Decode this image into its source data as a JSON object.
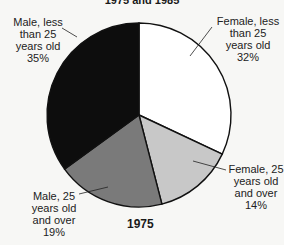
{
  "title_partial": "1975 and 1985",
  "chart_data": {
    "type": "pie",
    "title": "1975",
    "start_angle_deg": 90,
    "direction": "clockwise",
    "slices": [
      {
        "label": "Female, less than 25 years old",
        "value": 32,
        "color": "#ffffff"
      },
      {
        "label": "Female, 25 years old and over",
        "value": 14,
        "color": "#c8c8c8"
      },
      {
        "label": "Male, 25 years old and over",
        "value": 19,
        "color": "#7a7a7a"
      },
      {
        "label": "Male, less than 25 years old",
        "value": 35,
        "color": "#0d0d0d"
      }
    ]
  },
  "labels": {
    "female_lt25": {
      "l1": "Female, less",
      "l2": "than 25",
      "l3": "years old",
      "pct": "32%"
    },
    "female_25plus": {
      "l1": "Female, 25",
      "l2": "years old",
      "l3": "and over",
      "pct": "14%"
    },
    "male_25plus": {
      "l1": "Male, 25",
      "l2": "years old",
      "l3": "and over",
      "pct": "19%"
    },
    "male_lt25": {
      "l1": "Male, less",
      "l2": "than 25",
      "l3": "years old",
      "pct": "35%"
    }
  },
  "year_label": "1975"
}
